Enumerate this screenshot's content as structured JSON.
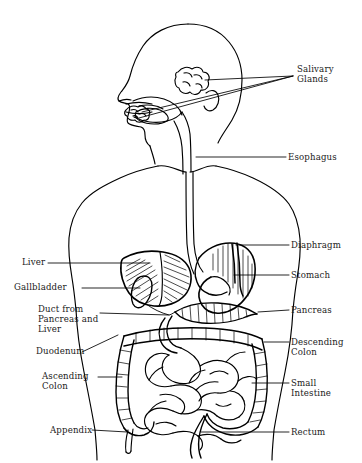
{
  "figure": {
    "kind": "anatomical-line-diagram",
    "view": "anterior torso with head in left profile",
    "width": 362,
    "height": 463,
    "background_color": "#ffffff",
    "ink_color": "#000000",
    "text_color": "#1a1a1a"
  },
  "labels": {
    "salivary_glands": "Salivary\nGlands",
    "esophagus": "Esophagus",
    "diaphragm": "Diaphragm",
    "stomach": "Stomach",
    "pancreas": "Pancreas",
    "descending_colon": "Descending\nColon",
    "small_intestine": "Small\nIntestine",
    "rectum": "Rectum",
    "liver": "Liver",
    "gallbladder": "Gallbladder",
    "duct_from_pancreas_and_liver": "Duct from\nPancreas and\nLiver",
    "duodenum": "Duodenum",
    "ascending_colon": "Ascending\nColon",
    "appendix": "Appendix"
  },
  "label_positions": {
    "salivary_glands": {
      "x": 297,
      "y": 64,
      "side": "right"
    },
    "esophagus": {
      "x": 288,
      "y": 152,
      "side": "right"
    },
    "diaphragm": {
      "x": 291,
      "y": 240,
      "side": "right"
    },
    "stomach": {
      "x": 291,
      "y": 270,
      "side": "right"
    },
    "pancreas": {
      "x": 291,
      "y": 305,
      "side": "right"
    },
    "descending_colon": {
      "x": 291,
      "y": 337,
      "side": "right"
    },
    "small_intestine": {
      "x": 291,
      "y": 378,
      "side": "right"
    },
    "rectum": {
      "x": 291,
      "y": 427,
      "side": "right"
    },
    "liver": {
      "x": 22,
      "y": 256,
      "side": "left"
    },
    "gallbladder": {
      "x": 14,
      "y": 281,
      "side": "left"
    },
    "duct_from_pancreas_and_liver": {
      "x": 38,
      "y": 305,
      "side": "left"
    },
    "duodenum": {
      "x": 36,
      "y": 348,
      "side": "left"
    },
    "ascending_colon": {
      "x": 42,
      "y": 373,
      "side": "left"
    },
    "appendix": {
      "x": 50,
      "y": 426,
      "side": "left"
    }
  },
  "organs": [
    "salivary glands",
    "esophagus",
    "diaphragm",
    "stomach",
    "liver",
    "gallbladder",
    "pancreas",
    "duodenum",
    "small intestine",
    "ascending colon",
    "descending colon",
    "appendix",
    "rectum"
  ]
}
